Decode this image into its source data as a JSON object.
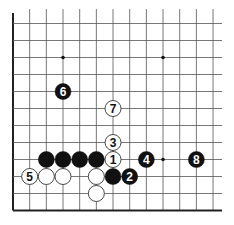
{
  "diagram": {
    "type": "go-board-diagram",
    "grid": {
      "columns": 13,
      "rows": 12,
      "origin_x": 13,
      "origin_y": 23.5,
      "col_spacing": 16.67,
      "row_spacing": 17,
      "edges": [
        "left",
        "bottom"
      ],
      "line_color": "#555555",
      "edge_color": "#222222"
    },
    "star_points": [
      {
        "col": 3,
        "row": 2
      },
      {
        "col": 9,
        "row": 2
      },
      {
        "col": 9,
        "row": 8
      }
    ],
    "stones": [
      {
        "color": "black",
        "col": 3,
        "row": 4,
        "label": "6"
      },
      {
        "color": "white",
        "col": 6,
        "row": 5,
        "label": "7"
      },
      {
        "color": "white",
        "col": 6,
        "row": 7,
        "label": "3"
      },
      {
        "color": "black",
        "col": 2,
        "row": 8,
        "label": ""
      },
      {
        "color": "black",
        "col": 3,
        "row": 8,
        "label": ""
      },
      {
        "color": "black",
        "col": 4,
        "row": 8,
        "label": ""
      },
      {
        "color": "black",
        "col": 5,
        "row": 8,
        "label": ""
      },
      {
        "color": "white",
        "col": 6,
        "row": 8,
        "label": "1"
      },
      {
        "color": "black",
        "col": 8,
        "row": 8,
        "label": "4"
      },
      {
        "color": "black",
        "col": 11,
        "row": 8,
        "label": "8"
      },
      {
        "color": "white",
        "col": 1,
        "row": 9,
        "label": "5"
      },
      {
        "color": "white",
        "col": 2,
        "row": 9,
        "label": ""
      },
      {
        "color": "white",
        "col": 3,
        "row": 9,
        "label": ""
      },
      {
        "color": "white",
        "col": 5,
        "row": 9,
        "label": ""
      },
      {
        "color": "black",
        "col": 6,
        "row": 9,
        "label": ""
      },
      {
        "color": "black",
        "col": 7,
        "row": 9,
        "label": "2"
      },
      {
        "color": "white",
        "col": 5,
        "row": 10,
        "label": ""
      }
    ],
    "colors": {
      "black_stone": "#111111",
      "white_stone": "#ffffff",
      "white_stone_border": "#333333",
      "black_label": "#ffffff",
      "white_label": "#111111"
    }
  }
}
